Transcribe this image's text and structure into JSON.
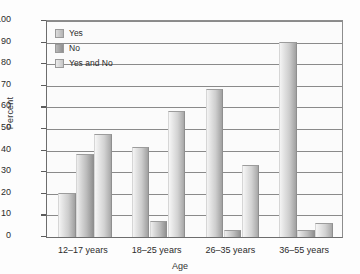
{
  "chart_data": {
    "type": "bar",
    "title": "",
    "xlabel": "Age",
    "ylabel": "Percent",
    "ylim": [
      0,
      100
    ],
    "ytick_step": 10,
    "grid": true,
    "legend_position": "top-left-inside",
    "categories": [
      "12–17 years",
      "18–25 years",
      "26–35 years",
      "36–55 years"
    ],
    "yticks": [
      "0",
      "10",
      "20",
      "30",
      "40",
      "50",
      "60",
      "70",
      "80",
      "90",
      "100"
    ],
    "series": [
      {
        "name": "Yes",
        "values": [
          20,
          41,
          68,
          90
        ],
        "color": "#b4b4b4"
      },
      {
        "name": "No",
        "values": [
          38,
          7,
          3,
          3
        ],
        "color": "#8f8f8f"
      },
      {
        "name": "Yes and No",
        "values": [
          47,
          58,
          33,
          6
        ],
        "color": "#c6c6c6"
      }
    ]
  },
  "legend": {
    "items": [
      {
        "label": "Yes"
      },
      {
        "label": "No"
      },
      {
        "label": "Yes and No"
      }
    ]
  },
  "axes": {
    "y_title": "Percent",
    "x_title": "Age"
  }
}
